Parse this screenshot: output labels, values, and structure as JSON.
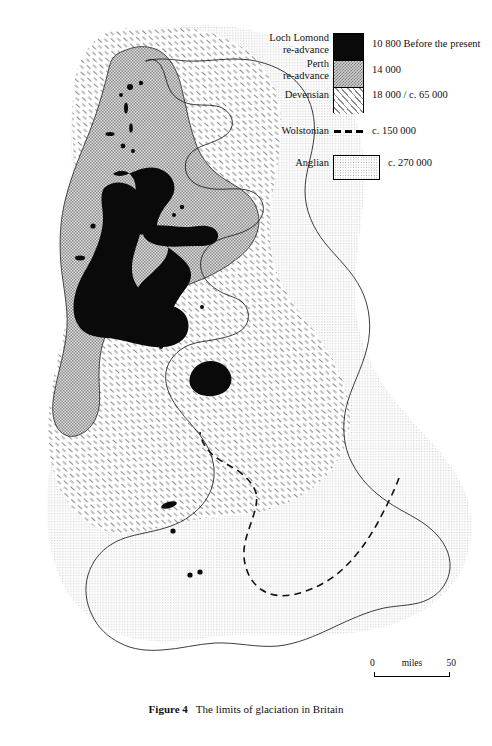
{
  "figure": {
    "caption_number": "Figure 4",
    "caption_text": "The limits of glaciation in Britain",
    "title": "The limits of glaciation in Britain"
  },
  "legend": {
    "entries": [
      {
        "key": "loch-lomond",
        "label": "Loch Lomond\nre-advance",
        "value": "10 800 Before the present",
        "years_bp": 10800,
        "swatch": "solid-black",
        "color": "#0a0a0a"
      },
      {
        "key": "perth",
        "label": "Perth\nre-advance",
        "value": "14 000",
        "years_bp": 14000,
        "swatch": "dense-stipple",
        "color": "#d2d2d2"
      },
      {
        "key": "devensian",
        "label": "Devensian",
        "value": "18 000 / c. 65 000",
        "years_bp": 18000,
        "swatch": "diagonal-hatch",
        "color": "#8c8c8c"
      },
      {
        "key": "wolstonian",
        "label": "Wolstonian",
        "value": "c. 150 000",
        "years_bp": 150000,
        "swatch": "dashed-line",
        "color": "#000000"
      },
      {
        "key": "anglian",
        "label": "Anglian",
        "value": "c. 270 000",
        "years_bp": 270000,
        "swatch": "light-stipple",
        "color": "#9a9a9a"
      }
    ]
  },
  "scale": {
    "unit_label": "miles",
    "min_label": "0",
    "max_label": "50",
    "min_value": 0,
    "max_value": 50
  },
  "map": {
    "region": "Britain",
    "coastline_color": "#1a1a1a",
    "background_color": "#ffffff",
    "layers": [
      {
        "name": "anglian-limit",
        "fill": "light-stipple"
      },
      {
        "name": "devensian-limit",
        "fill": "diagonal-hatch"
      },
      {
        "name": "perth-readvance",
        "fill": "dense-stipple"
      },
      {
        "name": "loch-lomond-readvance",
        "fill": "solid-black"
      },
      {
        "name": "wolstonian-limit",
        "fill": "dashed-line"
      },
      {
        "name": "coastline",
        "fill": "none"
      }
    ]
  }
}
